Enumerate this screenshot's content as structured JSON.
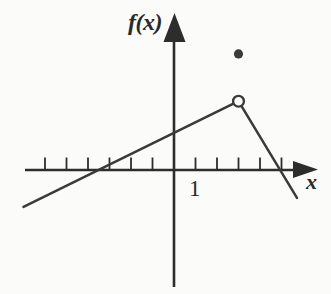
{
  "chart_data": {
    "type": "line",
    "title": "",
    "xlabel": "x",
    "ylabel": "f(x)",
    "xlim": [
      -7.1,
      6.7
    ],
    "ylim": [
      -5.5,
      7.3
    ],
    "grid": false,
    "legend": false,
    "x_ticks": [
      -6,
      -5,
      -4,
      -3,
      -2,
      -1,
      1,
      2,
      3,
      4,
      5
    ],
    "x_tick_labels": [
      {
        "value": 1,
        "label": "1"
      }
    ],
    "series": [
      {
        "name": "rising-branch",
        "points": [
          [
            -7.0,
            -1.72
          ],
          [
            3,
            3.2
          ]
        ]
      },
      {
        "name": "falling-branch",
        "points": [
          [
            3,
            3.2
          ],
          [
            5.72,
            -1.3
          ]
        ]
      }
    ],
    "special_points": [
      {
        "x": 3,
        "y": 3.2,
        "marker": "open-circle"
      },
      {
        "x": 3,
        "y": 5.4,
        "marker": "filled-dot"
      }
    ]
  },
  "style": {
    "background_color": "#fbfbf9",
    "curve_color": "#3a3a3a",
    "axis_color": "#2d2d2d",
    "marker_color": "#3b3b3b",
    "open_marker_fill": "#fdfdfc"
  }
}
